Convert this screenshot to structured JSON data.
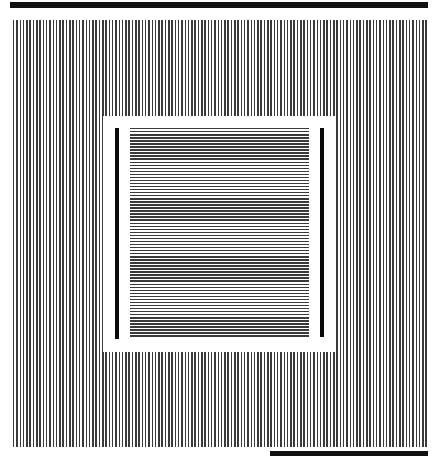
{
  "figure": {
    "colors": {
      "background": "#ffffff",
      "line": "#3a3a3a",
      "bar": "#0a0a0a"
    },
    "top_bar": {
      "x": 10,
      "y": 2,
      "w": 418,
      "h": 6
    },
    "bottom_bar": {
      "x": 270,
      "y": 451,
      "w": 158,
      "h": 5
    },
    "vertical_grating": {
      "x": 13,
      "y": 20,
      "w": 416,
      "h": 427,
      "period_px": 3.3
    },
    "inner_square": {
      "x": 103,
      "y": 116,
      "w": 232,
      "h": 236
    },
    "horizontal_grating": {
      "x": 130,
      "y": 128,
      "w": 179,
      "h": 210,
      "period_px": 3.05
    },
    "left_bar": {
      "x": 115,
      "y": 128,
      "w": 4,
      "h": 211
    },
    "right_bar": {
      "x": 320,
      "y": 128,
      "w": 4,
      "h": 209
    }
  }
}
